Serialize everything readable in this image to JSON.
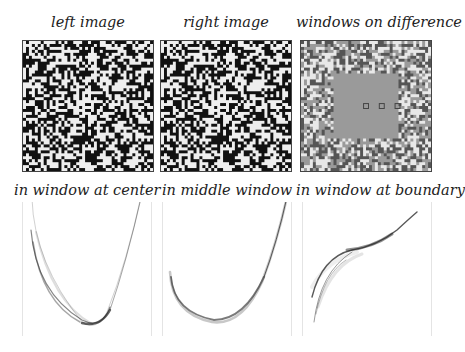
{
  "figure": {
    "top_row": [
      {
        "title": "left image"
      },
      {
        "title": "right image"
      },
      {
        "title": "windows on difference"
      }
    ],
    "bottom_row": [
      {
        "title": "in window at center"
      },
      {
        "title": "in middle window"
      },
      {
        "title": "in window at boundary"
      }
    ],
    "colors": {
      "noise_dark": "#111111",
      "noise_light": "#eeeeee",
      "difference_gray": "#9a9a9a",
      "curve": "#222222"
    }
  }
}
